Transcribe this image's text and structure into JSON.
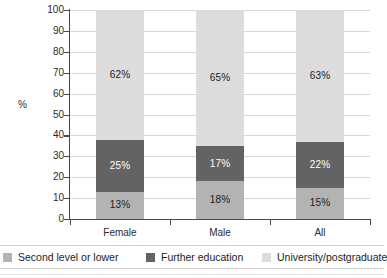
{
  "chart_data": {
    "type": "bar",
    "subtype": "stacked-100-percent",
    "title": "",
    "xlabel": "",
    "ylabel": "%",
    "ylim": [
      0,
      100
    ],
    "ytick_step": 10,
    "yticks": [
      100,
      90,
      80,
      70,
      60,
      50,
      40,
      30,
      20,
      10,
      0
    ],
    "grid": true,
    "legend_position": "bottom",
    "categories": [
      "Female",
      "Male",
      "All"
    ],
    "series": [
      {
        "name": "Second level or lower",
        "color": "#b3b3b3",
        "values": [
          13,
          18,
          15
        ],
        "labels": [
          "13%",
          "18%",
          "15%"
        ]
      },
      {
        "name": "Further education",
        "color": "#636363",
        "values": [
          25,
          17,
          22
        ],
        "labels": [
          "25%",
          "17%",
          "22%"
        ]
      },
      {
        "name": "University/postgraduate",
        "color": "#dcdcdc",
        "values": [
          62,
          65,
          63
        ],
        "labels": [
          "62%",
          "65%",
          "63%"
        ]
      }
    ]
  },
  "axis": {
    "y_title": "%",
    "tick_labels": [
      "100",
      "90",
      "80",
      "70",
      "60",
      "50",
      "40",
      "30",
      "20",
      "10",
      "0"
    ]
  },
  "legend": {
    "items": [
      {
        "label": "Second level or lower",
        "color": "#b3b3b3"
      },
      {
        "label": "Further education",
        "color": "#636363"
      },
      {
        "label": "University/postgraduate",
        "color": "#dcdcdc"
      }
    ]
  }
}
